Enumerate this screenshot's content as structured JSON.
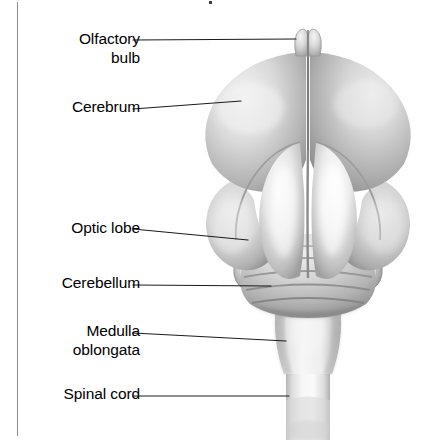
{
  "figure": {
    "view": "dorsal",
    "style": "grayscale airbrush anatomical illustration",
    "background_color": "#ffffff",
    "leader_line_color": "#1c1c1c",
    "text_color": "#000000",
    "page_edge_color": "#8d8d8d"
  },
  "labels": [
    {
      "id": "olfactory-bulb",
      "text": "Olfactory\nbulb",
      "x": 140,
      "y": 30,
      "line": {
        "x1": 133,
        "y1": 40,
        "x2": 296,
        "y2": 39
      }
    },
    {
      "id": "cerebrum",
      "text": "Cerebrum",
      "x": 140,
      "y": 98,
      "line": {
        "x1": 133,
        "y1": 109,
        "x2": 241,
        "y2": 101
      }
    },
    {
      "id": "optic-lobe",
      "text": "Optic lobe",
      "x": 140,
      "y": 219,
      "line": {
        "x1": 133,
        "y1": 229,
        "x2": 248,
        "y2": 240
      }
    },
    {
      "id": "cerebellum",
      "text": "Cerebellum",
      "x": 140,
      "y": 274,
      "line": {
        "x1": 133,
        "y1": 285,
        "x2": 271,
        "y2": 286
      }
    },
    {
      "id": "medulla-oblongata",
      "text": "Medulla\noblongata",
      "x": 140,
      "y": 322,
      "line": {
        "x1": 133,
        "y1": 333,
        "x2": 286,
        "y2": 341
      }
    },
    {
      "id": "spinal-cord",
      "text": "Spinal cord",
      "x": 140,
      "y": 385,
      "line": {
        "x1": 133,
        "y1": 396,
        "x2": 289,
        "y2": 396
      }
    }
  ],
  "structures": [
    {
      "id": "olfactory-bulb",
      "name": "Olfactory bulb",
      "description": "Small paired knob at the anterior tip with a central cleft"
    },
    {
      "id": "cerebrum",
      "name": "Cerebrum",
      "description": "Large paired hemispheres divided by a longitudinal fissure"
    },
    {
      "id": "optic-lobe",
      "name": "Optic lobe",
      "description": "Small rounded lobes flanking the cerebellum on each side"
    },
    {
      "id": "cerebellum",
      "name": "Cerebellum",
      "description": "Oval mass with transverse ridges behind the cerebrum"
    },
    {
      "id": "medulla-oblongata",
      "name": "Medulla oblongata",
      "description": "Tapering stalk below the cerebellum"
    },
    {
      "id": "spinal-cord",
      "name": "Spinal cord",
      "description": "Cylindrical cord continuing from the medulla"
    }
  ]
}
